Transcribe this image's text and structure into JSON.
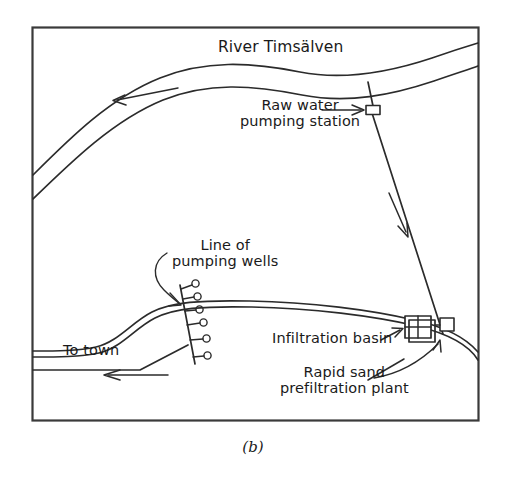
{
  "figure": {
    "caption": "(b)",
    "title_label": "River Timsälven",
    "border_color": "#3a3a3a",
    "line_color": "#2b2b2b",
    "background": "#ffffff"
  },
  "labels": {
    "river": "River Timsälven",
    "raw_water_pumping_station": "Raw water\npumping station",
    "line_of_pumping_wells": "Line of\npumping wells",
    "infiltration_basin": "Infiltration basin",
    "rapid_sand_prefiltration_plant": "Rapid sand\nprefiltration plant",
    "to_town": "To town"
  },
  "features": [
    {
      "name": "upper-river",
      "type": "double-line-river",
      "label": "River Timsälven",
      "flow_direction": "left"
    },
    {
      "name": "lower-river",
      "type": "double-line-river",
      "label": "",
      "flow_direction": "left"
    },
    {
      "name": "raw-water-pumping-station",
      "type": "structure-box",
      "label": "Raw water pumping station"
    },
    {
      "name": "infiltration-basin",
      "type": "grid-box-2x2",
      "label": "Infiltration basin"
    },
    {
      "name": "rapid-sand-prefiltration-plant",
      "type": "small-box",
      "label": "Rapid sand prefiltration plant"
    },
    {
      "name": "pumping-wells-line",
      "type": "well-line",
      "label": "Line of pumping wells",
      "well_count": 6
    },
    {
      "name": "raw-water-pipeline",
      "type": "pipeline",
      "label": "",
      "flow_direction": "down"
    },
    {
      "name": "to-town-pipeline",
      "type": "pipeline",
      "label": "To town",
      "flow_direction": "left"
    }
  ]
}
